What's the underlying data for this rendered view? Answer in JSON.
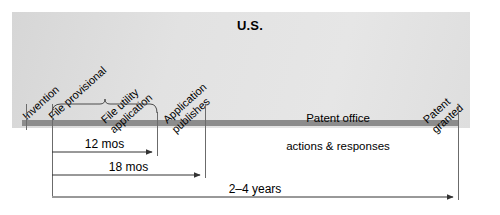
{
  "diagram": {
    "title": "U.S.",
    "type": "timeline",
    "panel_color": "#e0e0e0",
    "bar_color": "#8c8c8c",
    "line_color": "#444444"
  },
  "events": [
    {
      "id": "invention",
      "label": "Invention",
      "x": 26
    },
    {
      "id": "provisional",
      "label": "File provisional",
      "x": 52
    },
    {
      "id": "utility",
      "label": "File utility\napplication",
      "x": 157
    },
    {
      "id": "publishes",
      "label": "Application\npublishes",
      "x": 205
    },
    {
      "id": "granted",
      "label": "Patent\ngranted",
      "x": 458
    }
  ],
  "center_note": {
    "line1": "Patent office",
    "line2": "actions & responses"
  },
  "brace": {
    "label": "",
    "from": "provisional",
    "to": "utility"
  },
  "spans": [
    {
      "id": "span-12mos",
      "label": "12 mos",
      "from_x": 52,
      "to_x": 157,
      "y": 152
    },
    {
      "id": "span-18mos",
      "label": "18 mos",
      "from_x": 52,
      "to_x": 205,
      "y": 175
    },
    {
      "id": "span-2to4yr",
      "label": "2–4 years",
      "from_x": 52,
      "to_x": 458,
      "y": 197
    }
  ]
}
